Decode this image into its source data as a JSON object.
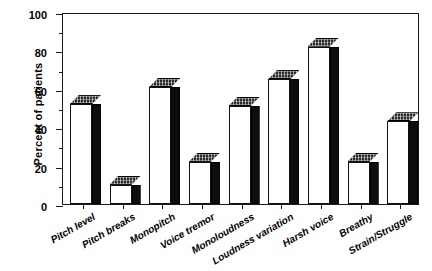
{
  "chart_data": {
    "type": "bar",
    "title": "",
    "subtitle": "",
    "xlabel": "",
    "ylabel": "Percent of patients",
    "ylim": [
      0,
      100
    ],
    "yticks": [
      0,
      20,
      40,
      60,
      80,
      100
    ],
    "ytick_labels": [
      "0",
      "20",
      "40",
      "60",
      "80",
      "100"
    ],
    "yminor_ticks": [
      10,
      30,
      50,
      70,
      90
    ],
    "grid": false,
    "legend": null,
    "legend_position": "none",
    "style": "3d-bar",
    "categories": [
      "Pitch level",
      "Pitch breaks",
      "Monopitch",
      "Voice tremor",
      "Monoloudness",
      "Loudness variation",
      "Harsh voice",
      "Breathy",
      "Strain/Struggle"
    ],
    "values": [
      52,
      10,
      61,
      22,
      51,
      65,
      82,
      22,
      43
    ],
    "annotations": []
  },
  "colors": {
    "bar_face": "#ffffff",
    "bar_side": "#0d0d0d",
    "bar_top": "#2a2a2a",
    "axis": "#1a1a1a",
    "text": "#000000",
    "background": "#ffffff"
  }
}
